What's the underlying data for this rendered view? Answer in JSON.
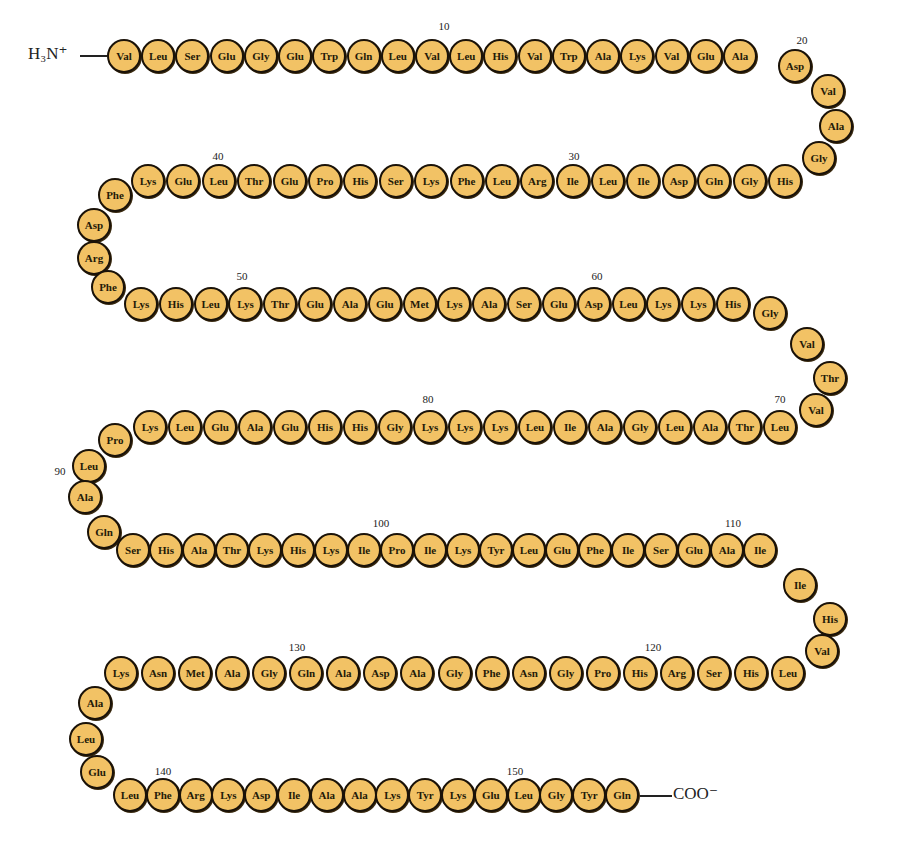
{
  "diagram": {
    "type": "protein primary structure (amino acid sequence chain)",
    "n_terminus": "H₃N⁺",
    "c_terminus": "COO⁻",
    "residue_count": 153,
    "colors": {
      "residue_fill": "#f2c265",
      "residue_outline": "#1a1208",
      "text": "#222222"
    },
    "sequence": [
      "Val",
      "Leu",
      "Ser",
      "Glu",
      "Gly",
      "Glu",
      "Trp",
      "Gln",
      "Leu",
      "Val",
      "Leu",
      "His",
      "Val",
      "Trp",
      "Ala",
      "Lys",
      "Val",
      "Glu",
      "Ala",
      "Asp",
      "Val",
      "Ala",
      "Gly",
      "His",
      "Gly",
      "Gln",
      "Asp",
      "Ile",
      "Leu",
      "Ile",
      "Arg",
      "Leu",
      "Phe",
      "Lys",
      "Ser",
      "His",
      "Pro",
      "Glu",
      "Thr",
      "Leu",
      "Glu",
      "Lys",
      "Phe",
      "Asp",
      "Arg",
      "Phe",
      "Lys",
      "His",
      "Leu",
      "Lys",
      "Thr",
      "Glu",
      "Ala",
      "Glu",
      "Met",
      "Lys",
      "Ala",
      "Ser",
      "Glu",
      "Asp",
      "Leu",
      "Lys",
      "Lys",
      "His",
      "Gly",
      "Val",
      "Thr",
      "Val",
      "Leu",
      "Thr",
      "Ala",
      "Leu",
      "Gly",
      "Ala",
      "Ile",
      "Leu",
      "Lys",
      "Lys",
      "Lys",
      "Gly",
      "His",
      "His",
      "Glu",
      "Ala",
      "Glu",
      "Leu",
      "Lys",
      "Pro",
      "Leu",
      "Ala",
      "Gln",
      "Ser",
      "His",
      "Ala",
      "Thr",
      "Lys",
      "His",
      "Lys",
      "Ile",
      "Pro",
      "Ile",
      "Lys",
      "Tyr",
      "Leu",
      "Glu",
      "Phe",
      "Ile",
      "Ser",
      "Glu",
      "Ala",
      "Ile",
      "Ile",
      "His",
      "Val",
      "Leu",
      "His",
      "Ser",
      "Arg",
      "His",
      "Pro",
      "Gly",
      "Asn",
      "Phe",
      "Gly",
      "Ala",
      "Asp",
      "Ala",
      "Gln",
      "Gly",
      "Ala",
      "Met",
      "Asn",
      "Lys",
      "Ala",
      "Leu",
      "Glu",
      "Leu",
      "Phe",
      "Arg",
      "Lys",
      "Asp",
      "Ile",
      "Ala",
      "Ala",
      "Lys",
      "Tyr",
      "Lys",
      "Glu",
      "Leu",
      "Gly",
      "Tyr",
      "Gln",
      "Gly"
    ],
    "position_markers": [
      "10",
      "20",
      "30",
      "40",
      "50",
      "60",
      "70",
      "80",
      "90",
      "100",
      "110",
      "120",
      "130",
      "140",
      "150"
    ]
  }
}
